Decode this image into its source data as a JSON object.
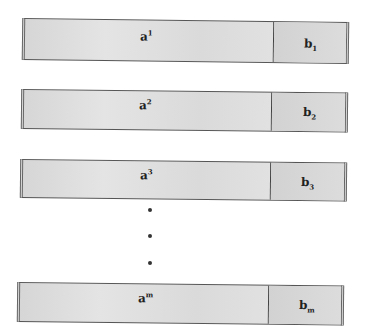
{
  "diagram": {
    "rows": [
      {
        "a_base": "a",
        "a_sup": "1",
        "b_base": "b",
        "b_sub": "1"
      },
      {
        "a_base": "a",
        "a_sup": "2",
        "b_base": "b",
        "b_sub": "2"
      },
      {
        "a_base": "a",
        "a_sup": "3",
        "b_base": "b",
        "b_sub": "3"
      },
      {
        "a_base": "a",
        "a_sup": "m",
        "b_base": "b",
        "b_sub": "m"
      }
    ],
    "ellipsis": [
      "•",
      "•",
      "•"
    ]
  }
}
